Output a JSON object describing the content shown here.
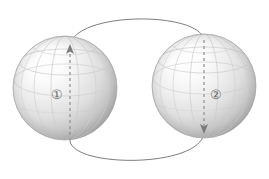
{
  "figure": {
    "title": "Two spheres connected by a flux loop",
    "background_color": "#ffffff",
    "width": 269,
    "height": 179
  },
  "spheres": [
    {
      "id": "sphere-1",
      "label": "①",
      "label_plain": "1",
      "label_x": 57,
      "label_y": 94,
      "center_x": 65,
      "center_y": 88,
      "radius": 52,
      "highlight_color": "#fdfdfd",
      "mid_color": "#dcdcdc",
      "shadow_color": "#b0b0b0",
      "edge_color": "#a8a8a8",
      "graticule_color": "#c9c9c9"
    },
    {
      "id": "sphere-2",
      "label": "②",
      "label_plain": "2",
      "label_x": 216,
      "label_y": 94,
      "center_x": 204,
      "center_y": 86,
      "radius": 52,
      "highlight_color": "#fdfdfd",
      "mid_color": "#dcdcdc",
      "shadow_color": "#b0b0b0",
      "edge_color": "#a8a8a8",
      "graticule_color": "#c9c9c9"
    }
  ],
  "axes": [
    {
      "id": "axis-1",
      "sphere": "sphere-1",
      "x": 70,
      "y_top": 46,
      "y_bottom": 141,
      "direction": "up",
      "style": "dashed",
      "color": "#8e8e8e",
      "dash_pattern": "3 3",
      "arrow_at": "top"
    },
    {
      "id": "axis-2",
      "sphere": "sphere-2",
      "x": 204,
      "y_top": 40,
      "y_bottom": 133,
      "direction": "down",
      "style": "dashed",
      "color": "#8e8e8e",
      "dash_pattern": "3 3",
      "arrow_at": "bottom"
    }
  ],
  "flux_loop": {
    "id": "flux-loop",
    "color": "#7d7d7d",
    "stroke_width": 1,
    "style": "solid",
    "top_arc": {
      "start_x": 70,
      "start_y": 46,
      "peak_y": 13,
      "end_x": 204,
      "end_y": 40
    },
    "bottom_arc": {
      "start_x": 70,
      "start_y": 141,
      "dip_y": 166,
      "end_x": 204,
      "end_y": 133
    }
  },
  "colors": {
    "background": "#ffffff",
    "line": "#7d7d7d",
    "dashed_line": "#8e8e8e",
    "label_text": "#6b6b6b",
    "sphere_edge": "#a8a8a8"
  }
}
